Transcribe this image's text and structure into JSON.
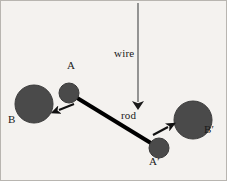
{
  "figure": {
    "name": "torsion-balance-diagram",
    "background_color": "#f4f2ef",
    "border_color": "#b8b5b0",
    "width": 227,
    "height": 181
  },
  "labels": {
    "sphere_a": "A",
    "sphere_b": "B",
    "sphere_a_prime": "A′",
    "sphere_b_prime": "B′",
    "wire": "wire",
    "rod": "rod"
  },
  "colors": {
    "sphere_fill": "#4a4a4a",
    "sphere_stroke": "#3a3a3a",
    "rod_color": "#000000",
    "wire_color": "#7b7b7b",
    "arrow_color": "#111111",
    "text_color": "#1a1a1a"
  },
  "geometry": {
    "wire": {
      "x": 137,
      "y_top": 2,
      "y_bottom": 103,
      "stroke_width": 1.6
    },
    "wire_arrowhead": {
      "x": 137,
      "y": 104,
      "width": 7,
      "height": 11
    },
    "rod": {
      "x1": 68,
      "y1": 92,
      "x2": 158,
      "y2": 147,
      "stroke_width": 4
    },
    "spheres": [
      {
        "id": "B",
        "cx": 33,
        "cy": 103,
        "r": 19,
        "size": "large"
      },
      {
        "id": "A",
        "cx": 68,
        "cy": 92,
        "r": 10,
        "size": "small"
      },
      {
        "id": "A'",
        "cx": 158,
        "cy": 147,
        "r": 10,
        "size": "small"
      },
      {
        "id": "B'",
        "cx": 192,
        "cy": 119,
        "r": 19,
        "size": "large"
      }
    ],
    "force_arrows": [
      {
        "id": "arrow-A-toward-B",
        "x1": 72,
        "y1": 104,
        "x2": 55,
        "y2": 110,
        "direction": "down-left"
      },
      {
        "id": "arrow-Ap-toward-Bp",
        "x1": 153,
        "y1": 133,
        "x2": 170,
        "y2": 124,
        "direction": "up-right"
      }
    ]
  }
}
